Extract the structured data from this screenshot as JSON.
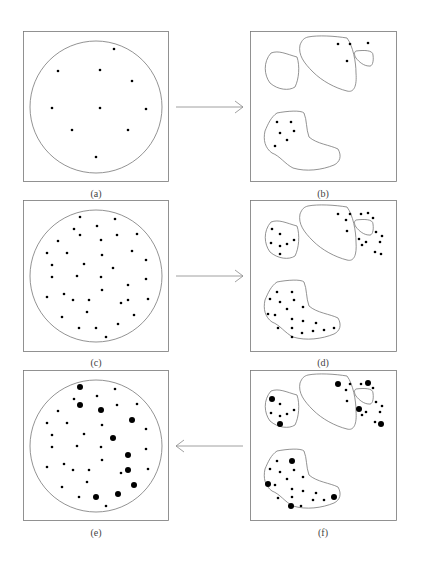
{
  "figure": {
    "panels": [
      {
        "id": "a",
        "caption": "(a)",
        "shape": "circle",
        "x": 23,
        "y": 31,
        "w": 146,
        "h": 151
      },
      {
        "id": "b",
        "caption": "(b)",
        "shape": "regions",
        "x": 250,
        "y": 31,
        "w": 147,
        "h": 151
      },
      {
        "id": "c",
        "caption": "(c)",
        "shape": "circle",
        "x": 23,
        "y": 200,
        "w": 146,
        "h": 152
      },
      {
        "id": "d",
        "caption": "(d)",
        "shape": "regions",
        "x": 250,
        "y": 200,
        "w": 147,
        "h": 152
      },
      {
        "id": "e",
        "caption": "(e)",
        "shape": "circle",
        "x": 23,
        "y": 370,
        "w": 146,
        "h": 151
      },
      {
        "id": "f",
        "caption": "(f)",
        "shape": "regions",
        "x": 250,
        "y": 370,
        "w": 147,
        "h": 151
      }
    ],
    "arrows": [
      {
        "from": "a",
        "to": "b",
        "direction": "right"
      },
      {
        "from": "c",
        "to": "d",
        "direction": "right"
      },
      {
        "from": "f",
        "to": "e",
        "direction": "left"
      }
    ],
    "colors": {
      "line": "#777777",
      "dot": "#000000",
      "text": "#444444"
    }
  }
}
